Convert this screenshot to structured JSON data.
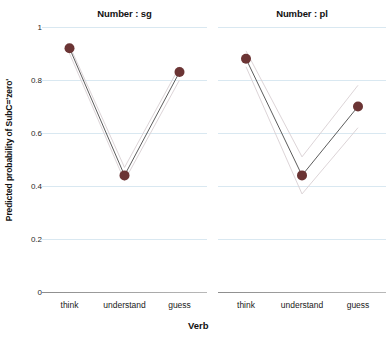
{
  "chart_data": {
    "type": "line",
    "title": "",
    "xlabel": "Verb",
    "ylabel": "Predicted probability of SubC='zero'",
    "categories": [
      "think",
      "understand",
      "guess"
    ],
    "ylim": [
      0,
      1
    ],
    "yticks": [
      "0",
      "0.2",
      "0.4",
      "0.6",
      "0.8",
      "1"
    ],
    "ytick_values": [
      0,
      0.2,
      0.4,
      0.6,
      0.8,
      1
    ],
    "grid": true,
    "legend": "none",
    "panel_variable": "Number",
    "marker_color": "#6b3434",
    "line_color": "#4a4a4a",
    "ci_color": "#d8cfd2",
    "grid_color": "#d9e8f1",
    "panels": [
      {
        "title": "Number : sg",
        "values": [
          0.92,
          0.44,
          0.83
        ],
        "ci_upper": [
          0.93,
          0.47,
          0.85
        ],
        "ci_lower": [
          0.9,
          0.42,
          0.8
        ]
      },
      {
        "title": "Number : pl",
        "values": [
          0.88,
          0.44,
          0.7
        ],
        "ci_upper": [
          0.91,
          0.51,
          0.78
        ],
        "ci_lower": [
          0.85,
          0.37,
          0.62
        ]
      }
    ]
  },
  "axis": {
    "ylabel": "Predicted probability of SubC='zero'",
    "xlabel": "Verb"
  }
}
